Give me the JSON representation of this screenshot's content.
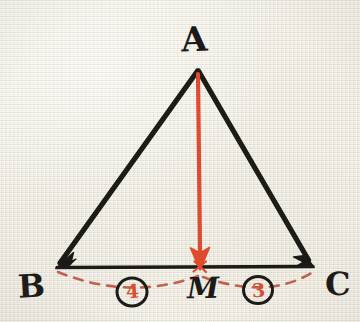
{
  "diagram": {
    "surface": "graph-paper-cream",
    "colors": {
      "paper": "#efece2",
      "ink_black": "#1c1a18",
      "ink_red": "#de4b2e",
      "dashed_red": "#c2604f"
    },
    "vertices": [
      {
        "id": "A",
        "label": "A",
        "x": 197,
        "y": 70,
        "label_x": 197,
        "label_y": 42
      },
      {
        "id": "B",
        "label": "B",
        "x": 56,
        "y": 267,
        "label_x": 30,
        "label_y": 290
      },
      {
        "id": "C",
        "label": "C",
        "x": 313,
        "y": 267,
        "label_x": 336,
        "label_y": 288
      },
      {
        "id": "M",
        "label": "M",
        "x": 200,
        "y": 267,
        "label_x": 200,
        "label_y": 292
      }
    ],
    "edges": [
      {
        "id": "AB",
        "from": "A",
        "to": "B",
        "color": "#1c1a18",
        "style": "solid",
        "arrow": "end"
      },
      {
        "id": "AC",
        "from": "A",
        "to": "C",
        "color": "#1c1a18",
        "style": "solid",
        "arrow": "end"
      },
      {
        "id": "BC",
        "from": "B",
        "to": "C",
        "color": "#1c1a18",
        "style": "solid",
        "arrow": "both"
      },
      {
        "id": "AM",
        "from": "A",
        "to": "M",
        "color": "#de4b2e",
        "style": "solid",
        "arrow": "end"
      }
    ],
    "arcs": [
      {
        "id": "arc-BM",
        "from": "B",
        "to": "M",
        "color": "#c2604f",
        "style": "dashed"
      },
      {
        "id": "arc-MC",
        "from": "M",
        "to": "C",
        "color": "#c2604f",
        "style": "dashed"
      }
    ],
    "markers": [
      {
        "id": "marker-4",
        "digit": "4",
        "segment": "BM",
        "x": 132,
        "y": 292,
        "digit_color": "#de4b2e",
        "circle_color": "#1c1a18"
      },
      {
        "id": "marker-3",
        "digit": "3",
        "segment": "MC",
        "x": 258,
        "y": 290,
        "digit_color": "#de4b2e",
        "circle_color": "#1c1a18"
      }
    ]
  }
}
